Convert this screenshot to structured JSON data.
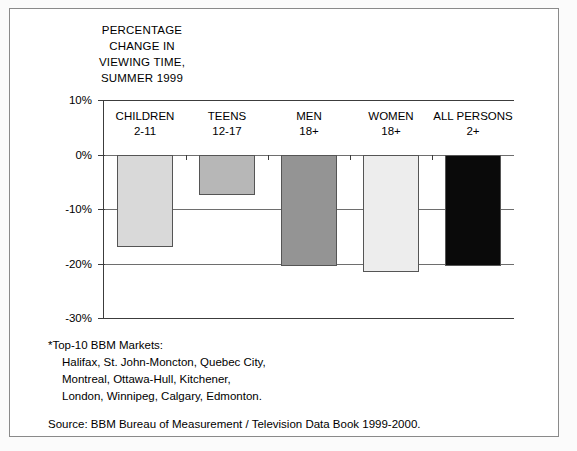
{
  "title": {
    "line1": "PERCENTAGE",
    "line2": "CHANGE IN",
    "line3": "VIEWING TIME,",
    "line4": "SUMMER 1999"
  },
  "footnote": {
    "line1": "*Top-10 BBM Markets:",
    "line2": "Halifax, St. John-Moncton, Quebec City,",
    "line3": "Montreal, Ottawa-Hull, Kitchener,",
    "line4": "London, Winnipeg, Calgary, Edmonton."
  },
  "source": "Source: BBM Bureau of Measurement / Television Data Book 1999-2000.",
  "axis": {
    "ticks": [
      "10%",
      "0%",
      "-10%",
      "-20%",
      "-30%"
    ]
  },
  "chart_data": {
    "type": "bar",
    "title": "PERCENTAGE CHANGE IN VIEWING TIME, SUMMER 1999",
    "xlabel": "",
    "ylabel": "",
    "ylim": [
      -30,
      10
    ],
    "ytick_values": [
      10,
      0,
      -10,
      -20,
      -30
    ],
    "ytick_labels": [
      "10%",
      "0%",
      "-10%",
      "-20%",
      "-30%"
    ],
    "grid": true,
    "legend": "none",
    "categories": [
      "CHILDREN 2-11",
      "TEENS 12-17",
      "MEN 18+",
      "WOMEN 18+",
      "ALL PERSONS 2+"
    ],
    "category_lines": [
      [
        "CHILDREN",
        "2-11"
      ],
      [
        "TEENS",
        "12-17"
      ],
      [
        "MEN",
        "18+"
      ],
      [
        "WOMEN",
        "18+"
      ],
      [
        "ALL PERSONS",
        "2+"
      ]
    ],
    "values": [
      -17,
      -7.5,
      -20.5,
      -21.5,
      -20.5
    ],
    "value_unit": "percent",
    "bar_colors": [
      "#d9d9d9",
      "#b7b7b7",
      "#949494",
      "#ededed",
      "#0a0a0a"
    ],
    "bar_edge_color": "#555555"
  }
}
